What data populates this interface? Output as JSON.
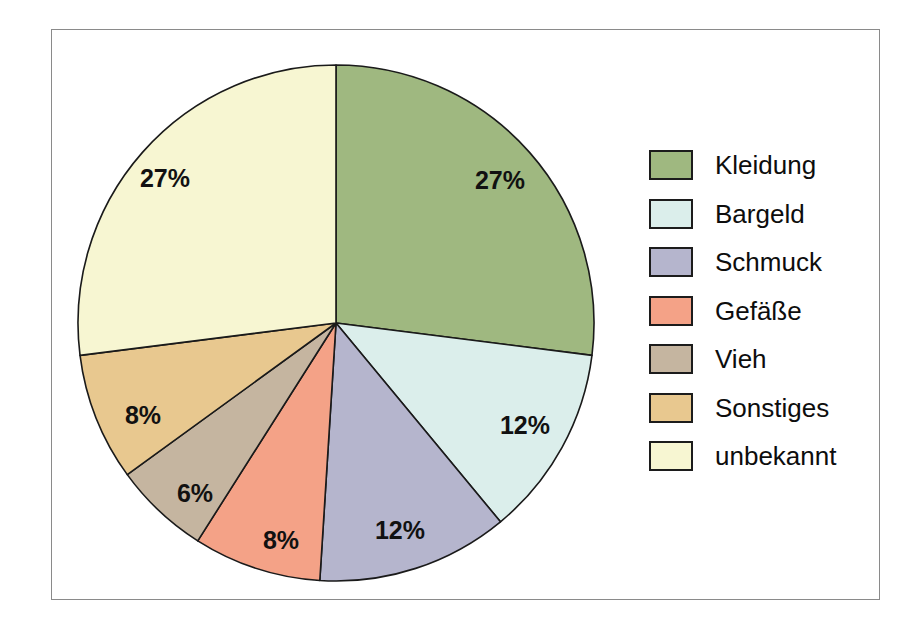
{
  "figure": {
    "background": "#ffffff",
    "frame_color": "#8a8a8a"
  },
  "legend": {
    "position": "right",
    "items": [
      {
        "label": "Kleidung",
        "color": "#9fb880"
      },
      {
        "label": "Bargeld",
        "color": "#dbeeeb"
      },
      {
        "label": "Schmuck",
        "color": "#b5b5cd"
      },
      {
        "label": "Gefäße",
        "color": "#f4a287"
      },
      {
        "label": "Vieh",
        "color": "#c5b5a0"
      },
      {
        "label": "Sonstiges",
        "color": "#e8c88f"
      },
      {
        "label": "unbekannt",
        "color": "#f7f6d2"
      }
    ]
  },
  "chart_data": {
    "type": "pie",
    "title": "",
    "start_angle_deg": 0,
    "direction": "clockwise",
    "labels_show_percent": true,
    "categories": [
      "Kleidung",
      "Bargeld",
      "Schmuck",
      "Gefäße",
      "Vieh",
      "Sonstiges",
      "unbekannt"
    ],
    "values": [
      27,
      12,
      12,
      8,
      6,
      8,
      27
    ],
    "value_labels": [
      "27%",
      "12%",
      "12%",
      "8%",
      "6%",
      "8%",
      "27%"
    ],
    "colors": [
      "#9fb880",
      "#dbeeeb",
      "#b5b5cd",
      "#f4a287",
      "#c5b5a0",
      "#e8c88f",
      "#f7f6d2"
    ],
    "slice_edge_color": "#1a1a1a",
    "label_positions": [
      {
        "category": "Kleidung",
        "x": 500,
        "y": 182
      },
      {
        "category": "Bargeld",
        "x": 525,
        "y": 427
      },
      {
        "category": "Schmuck",
        "x": 400,
        "y": 532
      },
      {
        "category": "Gefäße",
        "x": 281,
        "y": 542
      },
      {
        "category": "Vieh",
        "x": 195,
        "y": 495
      },
      {
        "category": "Sonstiges",
        "x": 143,
        "y": 417
      },
      {
        "category": "unbekannt",
        "x": 165,
        "y": 180
      }
    ]
  }
}
